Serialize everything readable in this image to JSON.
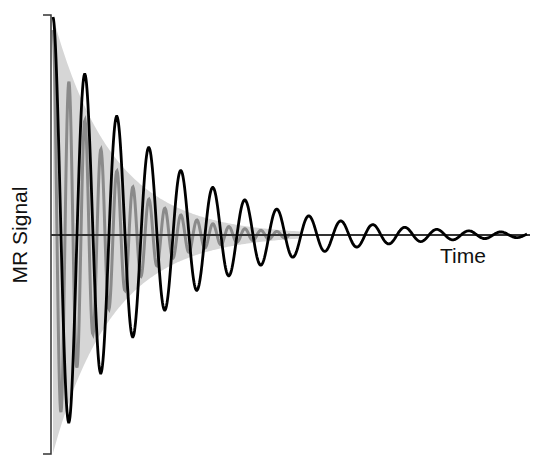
{
  "chart_data": {
    "type": "line",
    "title": "",
    "xlabel": "Time",
    "ylabel": "MR Signal",
    "grid": false,
    "legend": null,
    "axes": {
      "x_axis_y_px": 235,
      "y_axis_x_px": 51,
      "y_axis_top_px": 15,
      "y_axis_bottom_px": 454,
      "x_axis_end_px": 530
    },
    "series": [
      {
        "name": "slow-decaying signal (T2*)",
        "style": "black line",
        "color": "#000000",
        "model": "A*exp(-t/tau)*cos(2*pi*t/period)",
        "amplitude_px": 218,
        "tau_px": 105,
        "period_px": 32,
        "x_start_px": 53,
        "x_end_px": 527,
        "peaks": [
          {
            "x": 53,
            "y": 17
          },
          {
            "x": 82,
            "y": 74
          },
          {
            "x": 115,
            "y": 113
          },
          {
            "x": 147,
            "y": 145
          },
          {
            "x": 180,
            "y": 168
          },
          {
            "x": 211,
            "y": 185
          },
          {
            "x": 243,
            "y": 199
          }
        ],
        "troughs": [
          {
            "x": 66,
            "y": 424
          },
          {
            "x": 98,
            "y": 374
          },
          {
            "x": 130,
            "y": 337
          },
          {
            "x": 163,
            "y": 311
          },
          {
            "x": 195,
            "y": 291
          },
          {
            "x": 227,
            "y": 275
          }
        ]
      },
      {
        "name": "fast-decaying signal",
        "style": "gray line",
        "color": "#8a8a8a",
        "model": "A*exp(-t/tau)*cos(2*pi*t/period)",
        "amplitude_px": 205,
        "tau_px": 55,
        "period_px": 16,
        "x_start_px": 53,
        "x_end_px": 290
      },
      {
        "name": "envelope fill",
        "style": "light gray band",
        "color": "#d4d4d4",
        "model": "+/- A*exp(-t/tau)",
        "amplitude_px": 218,
        "tau_px": 60,
        "x_start_px": 53,
        "x_end_px": 300
      }
    ]
  },
  "labels": {
    "y_axis": "MR Signal",
    "x_axis": "Time"
  }
}
